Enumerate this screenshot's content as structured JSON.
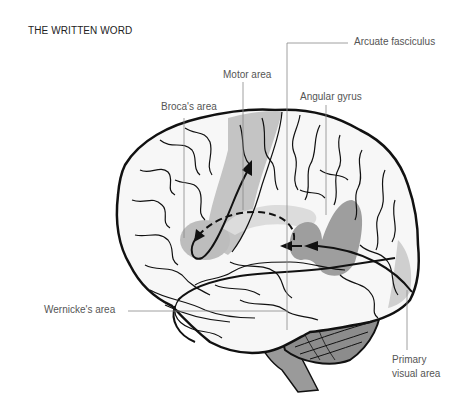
{
  "title": "THE WRITTEN WORD",
  "labels": {
    "arcuate": "Arcuate fasciculus",
    "motor": "Motor area",
    "broca": "Broca's area",
    "angular": "Angular gyrus",
    "wernicke": "Wernicke's area",
    "visual_line1": "Primary",
    "visual_line2": "visual area"
  },
  "colors": {
    "outline": "#111111",
    "brain_fill": "#f7f7f7",
    "region_light": "#c4c4c4",
    "region_dark": "#9a9a9a",
    "brainstem": "#9a9a9a",
    "cerebellum": "#8c8c8c",
    "leader_line": "#888888"
  }
}
